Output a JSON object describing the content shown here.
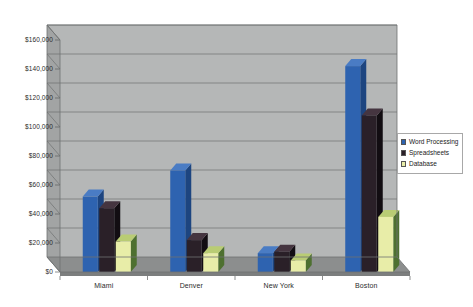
{
  "chart_data": {
    "type": "bar",
    "title": "",
    "subtitle": "",
    "xlabel": "",
    "ylabel": "",
    "categories": [
      "Miami",
      "Denver",
      "New York",
      "Boston"
    ],
    "series": [
      {
        "name": "Word Processing",
        "color": "#2e63b0",
        "side_color": "#1d4580",
        "top_color": "#4a7cc4",
        "values": [
          52000,
          70000,
          13000,
          142000
        ]
      },
      {
        "name": "Spreadsheets",
        "color": "#2a2028",
        "side_color": "#120d12",
        "top_color": "#453540",
        "values": [
          44000,
          22000,
          14000,
          108000
        ]
      },
      {
        "name": "Database",
        "color": "#e8eda8",
        "side_color": "#4e7030",
        "top_color": "#b9cc74",
        "values": [
          21000,
          13000,
          8000,
          38000
        ]
      }
    ],
    "ylim": [
      0,
      160000
    ],
    "ytick_step": 20000,
    "ytick_labels": [
      "$160,000",
      "$140,000",
      "$120,000",
      "$100,000",
      "$80,000",
      "$60,000",
      "$40,000",
      "$20,000",
      "$0"
    ],
    "grid": true,
    "legend_position": "right",
    "style": "3d-clustered-column",
    "colors": {
      "back_wall": "#b5b7b7",
      "side_wall": "#a2a4a4",
      "floor": "#8c8e8e",
      "floor_front": "#7c7e7e",
      "gridline": "#6f7171",
      "axis_line": "#5d5f5f",
      "plot_border": "#6f7171",
      "legend_border": "#a8a8a8",
      "legend_background": "#ffffff",
      "page_background": "#ffffff",
      "text": "#2b2b2b"
    }
  }
}
